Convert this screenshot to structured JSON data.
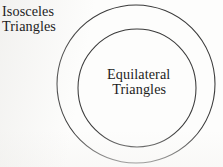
{
  "diagram": {
    "type": "euler-diagram",
    "background_color": "#fdfdfc",
    "stroke_color": "#3a3a3a",
    "text_color": "#1d1d1d",
    "sets": [
      {
        "id": "isosceles",
        "label_lines": [
          "Isosceles",
          "Triangles"
        ],
        "label_line_1": "Isosceles",
        "label_line_2": "Triangles",
        "shape": "circle",
        "center_x": 136,
        "center_y": 84,
        "radius": 79,
        "label_position": "outside-top-left"
      },
      {
        "id": "equilateral",
        "label_lines": [
          "Equilateral",
          "Triangles"
        ],
        "label_line_1": "Equilateral",
        "label_line_2": "Triangles",
        "shape": "circle",
        "center_x": 137,
        "center_y": 88,
        "radius": 59,
        "label_position": "inside-center"
      }
    ]
  }
}
